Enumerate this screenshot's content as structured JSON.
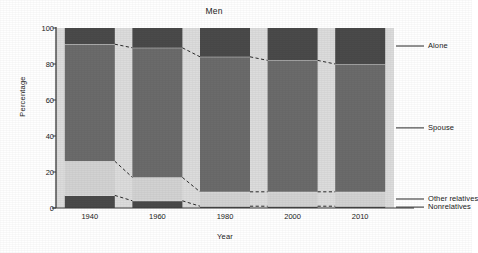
{
  "chart_data": {
    "type": "bar",
    "title": "Men",
    "xlabel": "Year",
    "ylabel": "Percentage",
    "categories": [
      "1940",
      "1960",
      "1980",
      "2000",
      "2010"
    ],
    "ylim": [
      0,
      100
    ],
    "yticks": [
      0,
      20,
      40,
      60,
      80,
      100
    ],
    "stacked": true,
    "stack_order_bottom_to_top": [
      "Nonrelatives",
      "Other relatives",
      "Spouse",
      "Alone"
    ],
    "grid": false,
    "legend_position": "right",
    "series": [
      {
        "name": "Nonrelatives",
        "values": [
          7,
          4,
          1,
          1,
          1
        ],
        "color": "#4f4f4f"
      },
      {
        "name": "Other relatives",
        "values": [
          19,
          13,
          8,
          8,
          8
        ],
        "color": "#c9c9c9"
      },
      {
        "name": "Spouse",
        "values": [
          65,
          72,
          75,
          73,
          68
        ],
        "color": "#6b6b6b"
      },
      {
        "name": "Alone",
        "values": [
          9,
          11,
          16,
          18,
          23
        ],
        "color": "#4a4a4a"
      }
    ],
    "segment_boundaries_percent": {
      "nonrelatives_top": [
        7,
        4,
        1,
        1,
        1
      ],
      "other_relatives_top": [
        26,
        17,
        9,
        9,
        9
      ],
      "spouse_top": [
        91,
        89,
        84,
        82,
        80
      ]
    },
    "annotations": [
      "dashed connector lines join equivalent segment boundaries between adjacent bars"
    ]
  },
  "legend": {
    "items": [
      {
        "label": "Alone"
      },
      {
        "label": "Spouse"
      },
      {
        "label": "Other relatives"
      },
      {
        "label": "Nonrelatives"
      }
    ]
  },
  "colors": {
    "plot_background": "#dcdcdc",
    "page_background": "#ffffff",
    "dark_segment": "#6b6b6b",
    "darker_segment": "#4a4a4a",
    "light_segment": "#d2d2d2",
    "axis": "#3a3a3a",
    "connector": "#2b2b2b",
    "separator": "#f2f2f2"
  }
}
